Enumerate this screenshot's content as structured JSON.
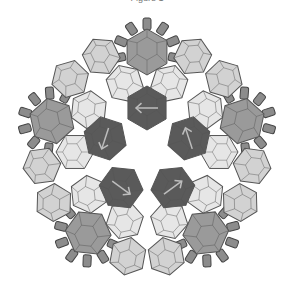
{
  "figure": {
    "caption_fragment": "Figure 1",
    "center": [
      147,
      152
    ],
    "symmetry": 5,
    "colors": {
      "background": "#ffffff",
      "outline": "#555555",
      "dark": "#5a5a5a",
      "medium": "#9a9a9a",
      "light": "#d2d2d2",
      "lighter": "#e6e6e6",
      "seed": "#8c8c8c",
      "arrow": "#bdbdbd"
    },
    "rings": {
      "inner_dark": {
        "radius": 44,
        "size": 22,
        "shade": "dark",
        "arrow": true
      },
      "mid_light": {
        "radius": 72,
        "size": 19,
        "shade": "lighter",
        "pairs_offset_deg": 20
      },
      "outer_medium": {
        "radius": 100,
        "size": 23,
        "shade": "medium"
      },
      "outer_light": {
        "radius": 102,
        "size": 19,
        "shade": "light",
        "pairs_offset_deg": 19
      },
      "seed_arcs": {
        "radius": 126,
        "count_per_arc": 7,
        "spread_deg": 44
      }
    }
  }
}
